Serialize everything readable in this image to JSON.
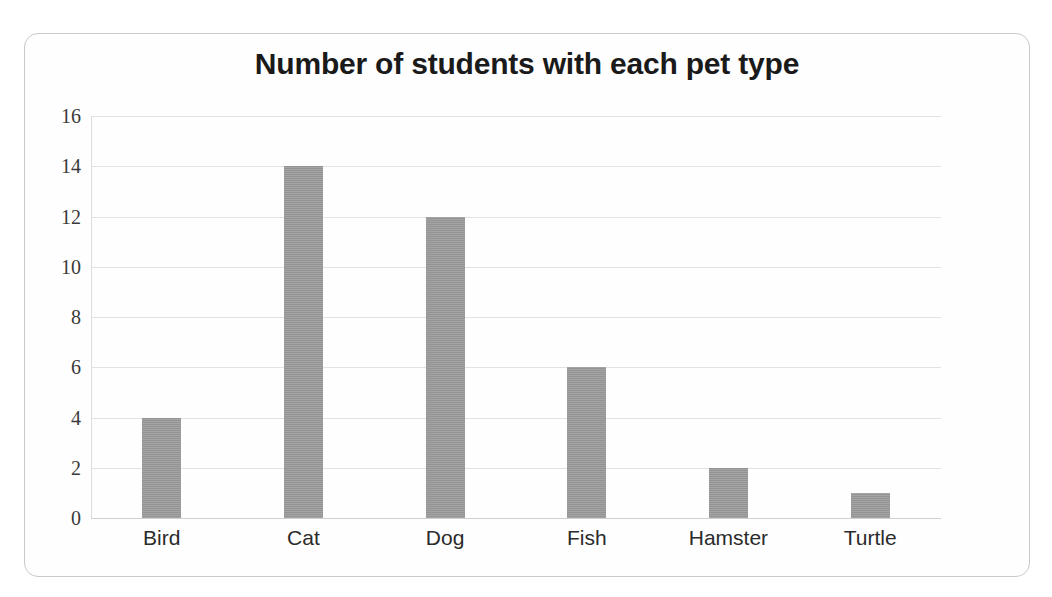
{
  "card": {
    "border_color": "#c9c9c9",
    "background": "#fefefe"
  },
  "chart_data": {
    "type": "bar",
    "title": "Number of students with each pet type",
    "subtitle": "",
    "xlabel": "",
    "ylabel": "",
    "categories": [
      "Bird",
      "Cat",
      "Dog",
      "Fish",
      "Hamster",
      "Turtle"
    ],
    "values": [
      4,
      14,
      12,
      6,
      2,
      1
    ],
    "series": [
      {
        "name": "Number of students",
        "values": [
          4,
          14,
          12,
          6,
          2,
          1
        ]
      }
    ],
    "ylim": [
      0,
      16
    ],
    "ytick_labels": [
      "16",
      "14",
      "12",
      "10",
      "8",
      "6",
      "4",
      "2",
      "0"
    ],
    "ytick_values": [
      16,
      14,
      12,
      10,
      8,
      6,
      4,
      2,
      0
    ],
    "ytick_step": 2,
    "grid": true,
    "grid_axis": "y",
    "grid_color": "#e2e2e2",
    "legend": false,
    "legend_position": "none",
    "bar_color": "#9a9a9a",
    "bar_count": 6,
    "annotations": []
  }
}
